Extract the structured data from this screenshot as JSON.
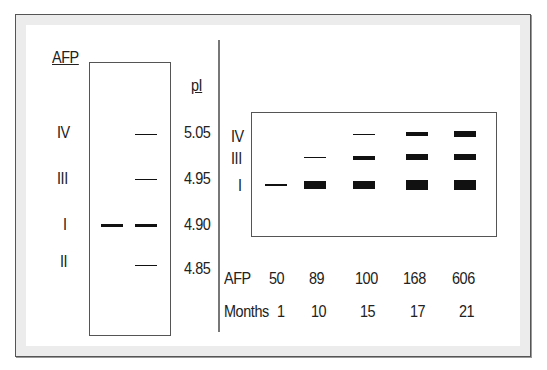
{
  "left_panel": {
    "title": "AFP",
    "scale_title": "pI",
    "band_labels": [
      "IV",
      "III",
      "I",
      "II"
    ],
    "pI_values": [
      "5.05",
      "4.95",
      "4.90",
      "4.85"
    ]
  },
  "right_panel": {
    "band_labels": [
      "IV",
      "III",
      "I"
    ],
    "row_labels": {
      "afp": "AFP",
      "months": "Months"
    },
    "afp_values": [
      "50",
      "89",
      "100",
      "168",
      "606"
    ],
    "months_values": [
      "1",
      "10",
      "15",
      "17",
      "21"
    ]
  },
  "colors": {
    "band": "#111111",
    "frame_border": "#555555",
    "frame_fill": "#ececec"
  }
}
